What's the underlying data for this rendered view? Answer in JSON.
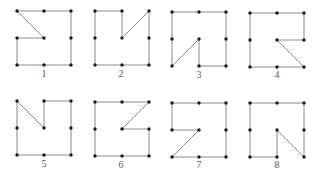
{
  "diagram": {
    "style": {
      "line_color": "#8a8a8a",
      "dot_color": "#1a1a1a",
      "label_color": "#555555",
      "background": "#ffffff"
    },
    "grid_spacing": 27,
    "figures": [
      {
        "label": "1",
        "origin": [
          17,
          11
        ],
        "label_pos": [
          44,
          74
        ],
        "path": [
          [
            0,
            0
          ],
          [
            2,
            0
          ],
          [
            2,
            2
          ],
          [
            0,
            2
          ],
          [
            0,
            1
          ],
          [
            1,
            1
          ]
        ],
        "dots": [
          [
            0,
            0
          ],
          [
            1,
            0
          ],
          [
            2,
            0
          ],
          [
            0,
            1
          ],
          [
            1,
            1
          ],
          [
            2,
            1
          ],
          [
            0,
            2
          ],
          [
            1,
            2
          ],
          [
            2,
            2
          ]
        ]
      },
      {
        "label": "2",
        "origin": [
          95,
          11
        ],
        "label_pos": [
          121,
          74
        ],
        "path": [
          [
            0,
            0
          ],
          [
            1,
            0
          ],
          [
            1,
            1
          ],
          [
            2,
            0
          ],
          [
            2,
            2
          ],
          [
            0,
            2
          ]
        ],
        "dots": [
          [
            0,
            0
          ],
          [
            1,
            0
          ],
          [
            2,
            0
          ],
          [
            0,
            1
          ],
          [
            1,
            1
          ],
          [
            2,
            1
          ],
          [
            0,
            2
          ],
          [
            1,
            2
          ],
          [
            2,
            2
          ]
        ]
      },
      {
        "label": "3",
        "origin": [
          172,
          12
        ],
        "label_pos": [
          199,
          75
        ],
        "path": [
          [
            0,
            0
          ],
          [
            2,
            0
          ],
          [
            2,
            2
          ],
          [
            1,
            2
          ],
          [
            1,
            1
          ],
          [
            0,
            2
          ]
        ],
        "dots": [
          [
            0,
            0
          ],
          [
            1,
            0
          ],
          [
            2,
            0
          ],
          [
            0,
            1
          ],
          [
            1,
            1
          ],
          [
            2,
            1
          ],
          [
            0,
            2
          ],
          [
            1,
            2
          ],
          [
            2,
            2
          ]
        ]
      },
      {
        "label": "4",
        "origin": [
          250,
          13
        ],
        "label_pos": [
          277,
          75
        ],
        "path": [
          [
            0,
            0
          ],
          [
            2,
            0
          ],
          [
            2,
            1
          ],
          [
            1,
            1
          ],
          [
            2,
            2
          ],
          [
            0,
            2
          ]
        ],
        "dots": [
          [
            0,
            0
          ],
          [
            1,
            0
          ],
          [
            2,
            0
          ],
          [
            0,
            1
          ],
          [
            1,
            1
          ],
          [
            2,
            1
          ],
          [
            0,
            2
          ],
          [
            1,
            2
          ],
          [
            2,
            2
          ]
        ]
      },
      {
        "label": "5",
        "origin": [
          17,
          101
        ],
        "label_pos": [
          44,
          164
        ],
        "path": [
          [
            0,
            0
          ],
          [
            1,
            1
          ],
          [
            1,
            0
          ],
          [
            2,
            0
          ],
          [
            2,
            2
          ],
          [
            0,
            2
          ]
        ],
        "dots": [
          [
            0,
            0
          ],
          [
            1,
            0
          ],
          [
            2,
            0
          ],
          [
            0,
            1
          ],
          [
            1,
            1
          ],
          [
            2,
            1
          ],
          [
            0,
            2
          ],
          [
            1,
            2
          ],
          [
            2,
            2
          ]
        ]
      },
      {
        "label": "6",
        "origin": [
          95,
          102
        ],
        "label_pos": [
          121,
          165
        ],
        "path": [
          [
            0,
            0
          ],
          [
            2,
            0
          ],
          [
            1,
            1
          ],
          [
            2,
            1
          ],
          [
            2,
            2
          ],
          [
            0,
            2
          ]
        ],
        "dots": [
          [
            0,
            0
          ],
          [
            1,
            0
          ],
          [
            2,
            0
          ],
          [
            0,
            1
          ],
          [
            1,
            1
          ],
          [
            2,
            1
          ],
          [
            0,
            2
          ],
          [
            1,
            2
          ],
          [
            2,
            2
          ]
        ]
      },
      {
        "label": "7",
        "origin": [
          172,
          103
        ],
        "label_pos": [
          199,
          165
        ],
        "path": [
          [
            0,
            0
          ],
          [
            2,
            0
          ],
          [
            2,
            2
          ],
          [
            0,
            2
          ],
          [
            1,
            1
          ],
          [
            0,
            1
          ]
        ],
        "dots": [
          [
            0,
            0
          ],
          [
            1,
            0
          ],
          [
            2,
            0
          ],
          [
            0,
            1
          ],
          [
            1,
            1
          ],
          [
            2,
            1
          ],
          [
            0,
            2
          ],
          [
            1,
            2
          ],
          [
            2,
            2
          ]
        ]
      },
      {
        "label": "8",
        "origin": [
          250,
          103
        ],
        "label_pos": [
          277,
          165
        ],
        "path": [
          [
            0,
            0
          ],
          [
            2,
            0
          ],
          [
            2,
            2
          ],
          [
            1,
            1
          ],
          [
            1,
            2
          ],
          [
            0,
            2
          ]
        ],
        "dots": [
          [
            0,
            0
          ],
          [
            1,
            0
          ],
          [
            2,
            0
          ],
          [
            0,
            1
          ],
          [
            1,
            1
          ],
          [
            2,
            1
          ],
          [
            0,
            2
          ],
          [
            1,
            2
          ],
          [
            2,
            2
          ]
        ]
      }
    ]
  }
}
